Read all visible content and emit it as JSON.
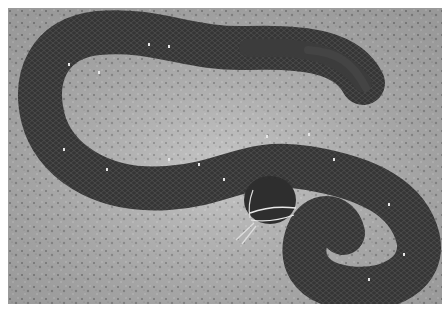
{
  "image": {
    "subject": "snake on gravel",
    "description": "Grayscale photograph of a dark-scaled snake with small white speckles, coiled in an S-shape on light speckled gravel, head facing lower-center with tongue extended",
    "colors": {
      "border": "#ffffff",
      "ground": "#a9a9a9",
      "ground_light": "#c8c8c8",
      "snake_body": "#3a3a3a",
      "snake_dark": "#222222",
      "speckle": "#e6e6e6"
    }
  }
}
